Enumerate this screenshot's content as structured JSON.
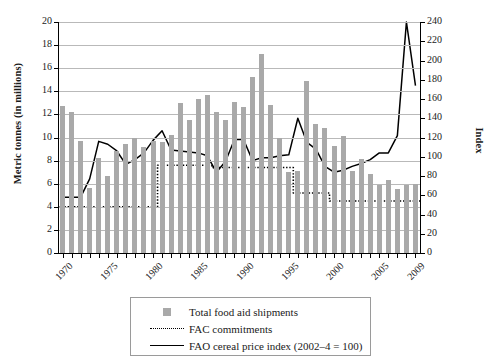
{
  "chart_data": {
    "type": "bar",
    "title": "",
    "xlabel": "",
    "ylabel": "Metric tonnes (in millions)",
    "y2label": "Index",
    "ylim": [
      0,
      20
    ],
    "y2lim": [
      0,
      240
    ],
    "grid": true,
    "legend_position": "below-center",
    "yticks": [
      "0",
      "2",
      "4",
      "6",
      "8",
      "10",
      "12",
      "14",
      "16",
      "18",
      "20"
    ],
    "y2ticks": [
      "0",
      "20",
      "40",
      "60",
      "80",
      "100",
      "120",
      "140",
      "160",
      "180",
      "200",
      "220",
      "240"
    ],
    "xticks_shown": [
      "1970",
      "1975",
      "1980",
      "1985",
      "1990",
      "1995",
      "2000",
      "2005",
      "2009"
    ],
    "x": [
      1970,
      1971,
      1972,
      1973,
      1974,
      1975,
      1976,
      1977,
      1978,
      1979,
      1980,
      1981,
      1982,
      1983,
      1984,
      1985,
      1986,
      1987,
      1988,
      1989,
      1990,
      1991,
      1992,
      1993,
      1994,
      1995,
      1996,
      1997,
      1998,
      1999,
      2000,
      2001,
      2002,
      2003,
      2004,
      2005,
      2006,
      2007,
      2008,
      2009
    ],
    "series": [
      {
        "name": "Total food aid shipments",
        "type": "bar",
        "axis": "left",
        "unit": "million metric tonnes",
        "color": "#a9a9a9",
        "values": [
          12.7,
          12.2,
          9.7,
          5.6,
          8.2,
          6.7,
          8.8,
          9.4,
          10.0,
          9.2,
          9.7,
          9.6,
          10.2,
          13.0,
          11.5,
          13.3,
          13.7,
          12.2,
          11.5,
          13.1,
          12.6,
          15.2,
          17.2,
          12.8,
          10.0,
          7.0,
          7.1,
          14.9,
          11.2,
          10.8,
          9.3,
          10.1,
          7.1,
          8.1,
          6.8,
          5.9,
          6.3,
          5.5,
          5.9,
          6.0
        ]
      },
      {
        "name": "FAC commitments",
        "type": "line",
        "style": "dotted",
        "axis": "left",
        "unit": "million metric tonnes",
        "color": "#000000",
        "values": [
          4.0,
          4.0,
          4.0,
          4.0,
          4.0,
          4.0,
          4.0,
          4.0,
          4.0,
          4.0,
          4.0,
          7.6,
          7.6,
          7.6,
          7.6,
          7.6,
          7.6,
          7.4,
          7.4,
          7.4,
          7.4,
          7.4,
          7.4,
          7.4,
          7.4,
          7.4,
          5.2,
          5.2,
          5.2,
          5.2,
          4.5,
          4.5,
          4.5,
          4.5,
          4.5,
          4.5,
          4.5,
          4.5,
          4.5,
          4.5
        ]
      },
      {
        "name": "FAO cereal price index (2002–4 = 100)",
        "type": "line",
        "style": "solid",
        "axis": "right",
        "unit": "index (2002-4 = 100)",
        "color": "#000000",
        "values": [
          58,
          58,
          58,
          77,
          116,
          113,
          106,
          92,
          97,
          104,
          117,
          127,
          107,
          106,
          105,
          104,
          101,
          84,
          95,
          118,
          118,
          96,
          99,
          99,
          101,
          102,
          140,
          115,
          108,
          90,
          84,
          86,
          90,
          93,
          97,
          104,
          104,
          122,
          240,
          174
        ]
      }
    ]
  },
  "legend": {
    "items": [
      {
        "key": "swatch",
        "label": "Total food aid shipments"
      },
      {
        "key": "dotted",
        "label": "FAC commitments"
      },
      {
        "key": "solid",
        "label": "FAO cereal price index (2002–4 = 100)"
      }
    ]
  },
  "colors": {
    "bar": "#a9a9a9",
    "line": "#000000",
    "grid": "#b9b9b9",
    "axis": "#000000",
    "background": "#ffffff"
  }
}
